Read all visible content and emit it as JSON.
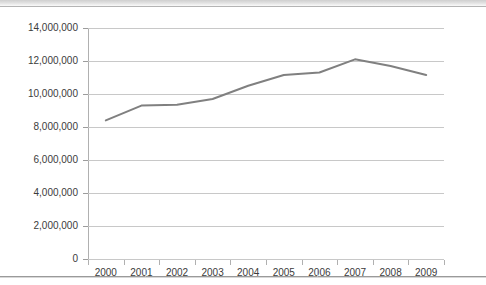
{
  "header": {
    "clipped_title": ""
  },
  "chart_data": {
    "type": "line",
    "title": "",
    "subtitle": "",
    "xlabel": "",
    "ylabel": "",
    "categories": [
      "2000",
      "2001",
      "2002",
      "2003",
      "2004",
      "2005",
      "2006",
      "2007",
      "2008",
      "2009"
    ],
    "series": [
      {
        "name": "Series 1",
        "color": "#808080",
        "values": [
          8400000,
          9300000,
          9350000,
          9700000,
          10500000,
          11150000,
          11300000,
          12100000,
          11700000,
          11150000
        ]
      }
    ],
    "ylim": [
      0,
      14000000
    ],
    "yticks": [
      0,
      2000000,
      4000000,
      6000000,
      8000000,
      10000000,
      12000000,
      14000000
    ],
    "ytick_labels": [
      "0",
      "2,000,000",
      "4,000,000",
      "6,000,000",
      "8,000,000",
      "10,000,000",
      "12,000,000",
      "14,000,000"
    ],
    "grid": true,
    "grid_axis": "y",
    "legend": false,
    "legend_position": "none",
    "markers": false,
    "line_width": 2,
    "colors": {
      "series": "#808080",
      "gridline": "#c8c8c8",
      "axis": "#b0b0b0",
      "text": "#3b3b3b",
      "background": "#ffffff"
    }
  }
}
